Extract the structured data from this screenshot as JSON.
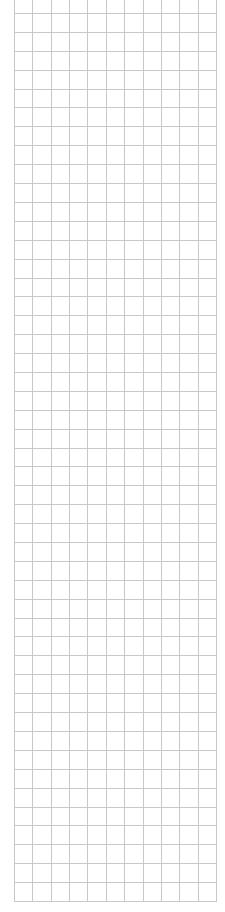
{
  "grid": {
    "background": "#ffffff",
    "line_color": "#c8c8c8",
    "x_start": 14,
    "x_end": 216,
    "columns": 11,
    "y_start": 13,
    "y_end": 901,
    "rows": 47,
    "vertical_lines_top": 0
  }
}
